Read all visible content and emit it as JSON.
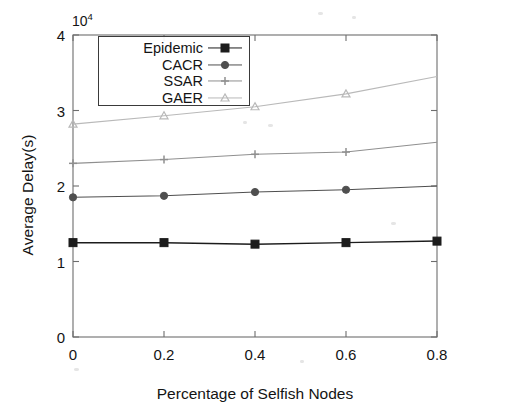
{
  "chart_data": {
    "type": "line",
    "title": "",
    "xlabel": "Percentage of Selfish Nodes",
    "ylabel": "Average Delay(s)",
    "y_multiplier": "10",
    "y_multiplier_exp": "4",
    "x": [
      0,
      0.2,
      0.4,
      0.6,
      0.8
    ],
    "xlim": [
      0,
      0.8
    ],
    "ylim": [
      0,
      4
    ],
    "xticks": [
      "0",
      "0.2",
      "0.4",
      "0.6",
      "0.8"
    ],
    "xtick_values": [
      0,
      0.2,
      0.4,
      0.6,
      0.8
    ],
    "yticks": [
      "0",
      "1",
      "2",
      "3",
      "4"
    ],
    "ytick_values": [
      0,
      1,
      2,
      3,
      4
    ],
    "grid": false,
    "legend_position": "upper left",
    "series": [
      {
        "name": "Epidemic",
        "marker": "square",
        "color": "#1c1c1c",
        "values": [
          1.25,
          1.25,
          1.23,
          1.25,
          1.27
        ]
      },
      {
        "name": "CACR",
        "marker": "circle",
        "color": "#4f4f4f",
        "values": [
          1.85,
          1.87,
          1.92,
          1.95,
          2.0
        ]
      },
      {
        "name": "SSAR",
        "marker": "cross",
        "color": "#8f8f8f",
        "values": [
          2.3,
          2.35,
          2.42,
          2.45,
          2.58
        ]
      },
      {
        "name": "GAER",
        "marker": "triangle",
        "color": "#b9b9b9",
        "values": [
          2.82,
          2.93,
          3.05,
          3.22,
          3.45
        ]
      }
    ]
  },
  "axes": {
    "frame_color": "#6d6d6d"
  }
}
